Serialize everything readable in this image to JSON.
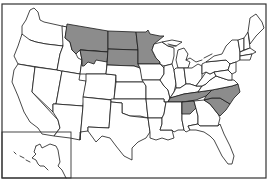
{
  "map": {
    "title": "",
    "region": "United States",
    "highlight_color": "#8c8c8c",
    "base_color": "#ffffff",
    "border_color": "#1a1a1a",
    "highlighted_states": [
      "Montana",
      "North Dakota",
      "South Dakota",
      "Minnesota",
      "Wyoming (southwest portion)",
      "Tennessee",
      "North Carolina",
      "South Carolina",
      "Alabama (northern portion)"
    ],
    "insets": [
      "Alaska"
    ]
  }
}
